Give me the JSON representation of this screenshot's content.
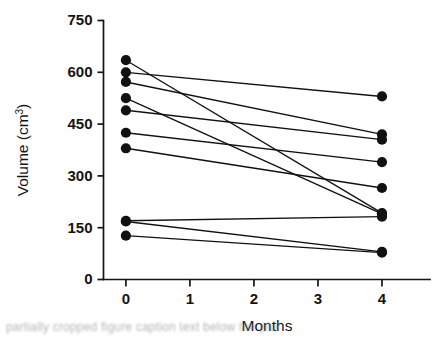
{
  "chart_data": {
    "type": "line",
    "title": "",
    "subtitle": "",
    "xlabel": "Months",
    "ylabel": "Volume (cm³)",
    "ylabel_base": "Volume (cm",
    "ylabel_sup": "3",
    "ylabel_close": ")",
    "x": [
      0,
      4
    ],
    "xlim": [
      -0.35,
      4.75
    ],
    "ylim": [
      0,
      750
    ],
    "xticks": [
      0,
      1,
      2,
      3,
      4
    ],
    "xticklabels": [
      "0",
      "1",
      "2",
      "3",
      "4"
    ],
    "yticks": [
      0,
      150,
      300,
      450,
      600,
      750
    ],
    "yticklabels": [
      "0",
      "150",
      "300",
      "450",
      "600",
      "750"
    ],
    "grid": false,
    "legend": null,
    "legend_position": "none",
    "marker": "filled-circle",
    "marker_color": "#111111",
    "line_color": "#111111",
    "series": [
      {
        "name": "subject-1",
        "values": [
          635,
          192
        ]
      },
      {
        "name": "subject-2",
        "values": [
          600,
          530
        ]
      },
      {
        "name": "subject-3",
        "values": [
          572,
          420
        ]
      },
      {
        "name": "subject-4",
        "values": [
          525,
          190
        ]
      },
      {
        "name": "subject-5",
        "values": [
          490,
          405
        ]
      },
      {
        "name": "subject-6",
        "values": [
          425,
          340
        ]
      },
      {
        "name": "subject-7",
        "values": [
          380,
          265
        ]
      },
      {
        "name": "subject-8",
        "values": [
          170,
          182
        ]
      },
      {
        "name": "subject-9",
        "values": [
          168,
          80
        ]
      },
      {
        "name": "subject-10",
        "values": [
          127,
          78
        ]
      }
    ],
    "n_subjects": 10,
    "axis_color": "#141414"
  },
  "caption": {
    "text": "partially cropped figure caption text below the plot"
  }
}
